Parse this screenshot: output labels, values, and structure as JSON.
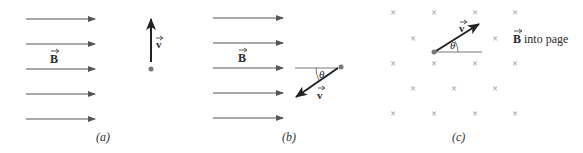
{
  "panels": [
    {
      "id": "a",
      "caption": "(a)",
      "field_label": "B",
      "field_description": "uniform field pointing right",
      "velocity_label": "v",
      "velocity_direction": "up, perpendicular to B"
    },
    {
      "id": "b",
      "caption": "(b)",
      "field_label": "B",
      "field_description": "uniform field pointing right",
      "velocity_label": "v",
      "angle_label": "θ",
      "velocity_direction": "down-left at angle θ below horizontal"
    },
    {
      "id": "c",
      "caption": "(c)",
      "field_label": "B",
      "field_suffix": "into page",
      "field_symbol": "×",
      "velocity_label": "v",
      "angle_label": "θ",
      "velocity_direction": "up-right at angle θ above horizontal"
    }
  ],
  "colors": {
    "field_lines": "#555555",
    "vector": "#222222",
    "particle": "#777777",
    "cross": "#888888"
  }
}
